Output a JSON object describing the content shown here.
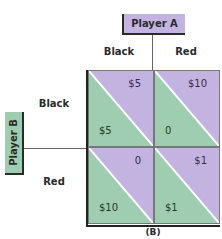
{
  "players": {
    "a": {
      "label": "Player A"
    },
    "b": {
      "label": "Player B"
    }
  },
  "strategies": {
    "columns": [
      "Black",
      "Red"
    ],
    "rows": [
      "Black",
      "Red"
    ]
  },
  "payoffs": [
    [
      {
        "a": "$5",
        "b": "$5"
      },
      {
        "a": "$10",
        "b": "0"
      }
    ],
    [
      {
        "a": "0",
        "b": "$10"
      },
      {
        "a": "$1",
        "b": "$1"
      }
    ]
  ],
  "colors": {
    "player_a": "#c2b3e0",
    "player_b": "#9fcdb1",
    "divider": "#ffffff"
  },
  "caption": "(B)"
}
